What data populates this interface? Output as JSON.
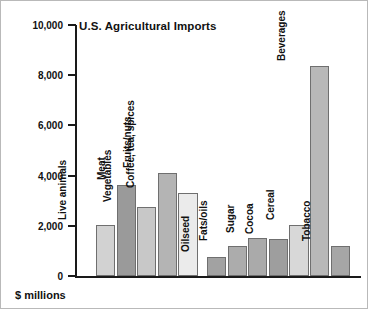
{
  "chart_data": {
    "type": "bar",
    "title": "U.S. Agricultural Imports",
    "xlabel": "",
    "ylabel": "$ millions",
    "ylim": [
      0,
      10000
    ],
    "ytick_labels": [
      "10,000",
      "8,000",
      "6,000",
      "4,000",
      "2,000",
      "0"
    ],
    "ytick_values": [
      10000,
      8000,
      6000,
      4000,
      2000,
      0
    ],
    "grid": false,
    "legend": "none",
    "categories": [
      "Live animals",
      "Meat",
      "Vegetables",
      "Fruits/nuts",
      "Coffee, tea, spices",
      "Oilseed",
      "Fats/oils",
      "Sugar",
      "Cocoa",
      "Cereal",
      "Beverages",
      "Tobacco"
    ],
    "values": [
      2050,
      3620,
      2750,
      4120,
      3300,
      750,
      1180,
      1500,
      1490,
      2050,
      8380,
      1180
    ],
    "bar_colors": [
      "#d2d2d2",
      "#9a9a9a",
      "#c8c8c8",
      "#b4b4b4",
      "#ebebeb",
      "#a2a2a2",
      "#acacac",
      "#aaaaaa",
      "#9e9e9e",
      "#d8d8d8",
      "#b8b8b8",
      "#a6a6a6"
    ],
    "group_break_after_index": 4
  },
  "figure": {
    "caption": "$ millions",
    "axis_color": "#1a1a1a",
    "bar_outline_color": "#6f6f6f",
    "background": "#ffffff",
    "border_color": "#b9b9b9"
  }
}
